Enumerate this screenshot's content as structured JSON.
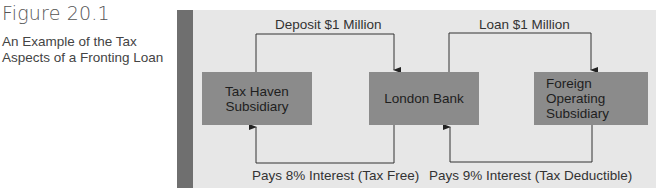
{
  "figure": {
    "number": "Figure 20.1",
    "caption": "An Example of the Tax Aspects of a Fronting Loan"
  },
  "diagram": {
    "nodes": [
      {
        "id": "tax-haven",
        "label_line1": "Tax Haven",
        "label_line2": "Subsidiary"
      },
      {
        "id": "london-bank",
        "label_line1": "London Bank",
        "label_line2": ""
      },
      {
        "id": "foreign-op",
        "label_line1": "Foreign Operating",
        "label_line2": "Subsidiary"
      }
    ],
    "edges": [
      {
        "from": "tax-haven",
        "to": "london-bank",
        "label": "Deposit $1 Million"
      },
      {
        "from": "london-bank",
        "to": "foreign-op",
        "label": "Loan $1 Million"
      },
      {
        "from": "london-bank",
        "to": "tax-haven",
        "label": "Pays 8% Interest (Tax Free)"
      },
      {
        "from": "foreign-op",
        "to": "london-bank",
        "label": "Pays 9% Interest (Tax Deductible)"
      }
    ]
  },
  "colors": {
    "panel": "#e7e7e7",
    "stripe": "#6f6f6f",
    "box": "#8b8b8b",
    "line": "#333333"
  }
}
